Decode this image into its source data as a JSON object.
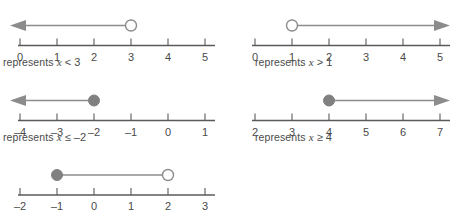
{
  "figure": {
    "colors": {
      "axis": "#5a5a5a",
      "ray": "#8c8c8c",
      "marker_fill": "#808080",
      "marker_stroke": "#8c8c8c",
      "open_fill": "#ffffff",
      "text": "#4a4a4a",
      "background": "#ffffff"
    },
    "geometry": {
      "tick_spacing": 37,
      "marker_radius": 5.5,
      "axis_y": 34,
      "line_y": 14
    }
  },
  "panels": [
    {
      "id": "panel-x-lt-3",
      "position": "top-left",
      "ticks": [
        "0",
        "1",
        "2",
        "3",
        "4",
        "5"
      ],
      "tick_values": [
        0,
        1,
        2,
        3,
        4,
        5
      ],
      "marker": {
        "value": 3,
        "type": "open"
      },
      "ray": {
        "direction": "left",
        "arrow": true
      },
      "caption": {
        "prefix": "represents",
        "variable": "x",
        "relation": "<",
        "value": "3"
      }
    },
    {
      "id": "panel-x-gt-1",
      "position": "top-right",
      "ticks": [
        "0",
        "1",
        "2",
        "3",
        "4",
        "5"
      ],
      "tick_values": [
        0,
        1,
        2,
        3,
        4,
        5
      ],
      "marker": {
        "value": 1,
        "type": "open"
      },
      "ray": {
        "direction": "right",
        "arrow": true
      },
      "caption": {
        "prefix": "represents",
        "variable": "x",
        "relation": ">",
        "value": "1"
      }
    },
    {
      "id": "panel-x-le-neg2",
      "position": "middle-left",
      "ticks": [
        "–4",
        "–3",
        "–2",
        "–1",
        "0",
        "1"
      ],
      "tick_values": [
        -4,
        -3,
        -2,
        -1,
        0,
        1
      ],
      "marker": {
        "value": -2,
        "type": "closed"
      },
      "ray": {
        "direction": "left",
        "arrow": true
      },
      "caption": {
        "prefix": "represents",
        "variable": "x",
        "relation": "≤",
        "value": "–2"
      }
    },
    {
      "id": "panel-x-ge-4",
      "position": "middle-right",
      "ticks": [
        "2",
        "3",
        "4",
        "5",
        "6",
        "7"
      ],
      "tick_values": [
        2,
        3,
        4,
        5,
        6,
        7
      ],
      "marker": {
        "value": 4,
        "type": "closed"
      },
      "ray": {
        "direction": "right",
        "arrow": true
      },
      "caption": {
        "prefix": "represents",
        "variable": "x",
        "relation": "≥",
        "value": "4"
      }
    },
    {
      "id": "panel-segment-neg1-to-2",
      "position": "bottom-left",
      "ticks": [
        "–2",
        "–1",
        "0",
        "1",
        "2",
        "3"
      ],
      "tick_values": [
        -2,
        -1,
        0,
        1,
        2,
        3
      ],
      "segment": {
        "from": -1,
        "from_type": "closed",
        "to": 2,
        "to_type": "open"
      },
      "caption": null
    }
  ]
}
